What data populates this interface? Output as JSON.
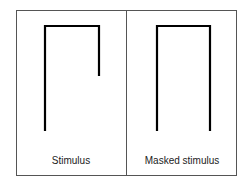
{
  "panels": [
    {
      "label": "Stimulus",
      "shape": "incomplete-arch"
    },
    {
      "label": "Masked stimulus",
      "shape": "complete-arch"
    }
  ]
}
